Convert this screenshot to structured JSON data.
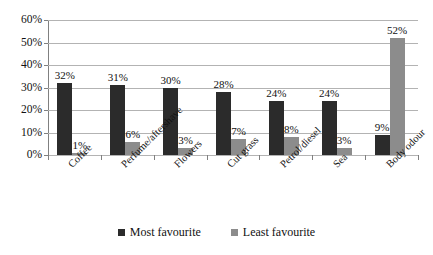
{
  "chart_data": {
    "type": "bar",
    "title": "",
    "subtitle": "",
    "xlabel": "",
    "ylabel": "",
    "ylim": [
      0,
      60
    ],
    "ytick_labels": [
      "0%",
      "10%",
      "20%",
      "30%",
      "40%",
      "50%",
      "60%"
    ],
    "ytick_values": [
      0,
      10,
      20,
      30,
      40,
      50,
      60
    ],
    "grid": true,
    "legend_position": "bottom",
    "categories": [
      "Coffee",
      "Perfume/aftershave",
      "Flowers",
      "Cut grass",
      "Petrol/diesel",
      "Sea",
      "Body odour"
    ],
    "series": [
      {
        "name": "Most favourite",
        "color": "#2b2b2b",
        "values": [
          32,
          31,
          30,
          28,
          24,
          24,
          9
        ],
        "data_labels": [
          "32%",
          "31%",
          "30%",
          "28%",
          "24%",
          "24%",
          "9%"
        ]
      },
      {
        "name": "Least favourite",
        "color": "#8c8c8c",
        "values": [
          1,
          6,
          3,
          7,
          8,
          3,
          52
        ],
        "data_labels": [
          "1%",
          "6%",
          "3%",
          "7%",
          "8%",
          "3%",
          "52%"
        ]
      }
    ]
  },
  "legend": {
    "items": [
      {
        "label": "Most favourite",
        "swatch": "most"
      },
      {
        "label": "Least favourite",
        "swatch": "least"
      }
    ]
  }
}
